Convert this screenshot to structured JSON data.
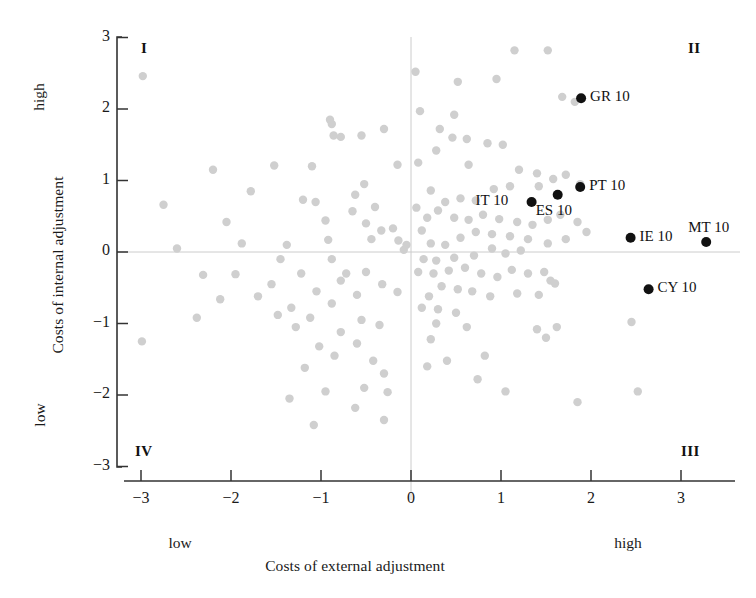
{
  "figure": {
    "background_color": "#ffffff",
    "point_color_normal": "#cfcfcf",
    "point_color_highlight": "#111111",
    "axis_color": "#222222",
    "zero_line_color": "#cccccc"
  },
  "axes": {
    "x_title": "Costs of external adjustment",
    "y_title": "Costs of internal adjustment",
    "x_low_label": "low",
    "x_high_label": "high",
    "y_low_label": "low",
    "y_high_label": "high",
    "x_ticks": [
      "−3",
      "−2",
      "−1",
      "0",
      "1",
      "2",
      "3"
    ],
    "y_ticks": [
      "3",
      "2",
      "1",
      "0",
      "−1",
      "−2",
      "−3"
    ]
  },
  "quadrants": [
    {
      "name": "quadrant-I",
      "label": "I",
      "x": 141,
      "y": 40
    },
    {
      "name": "quadrant-II",
      "label": "II",
      "x": 688,
      "y": 40
    },
    {
      "name": "quadrant-III",
      "label": "III",
      "x": 681,
      "y": 443
    },
    {
      "name": "quadrant-IV",
      "label": "IV",
      "x": 135,
      "y": 443
    }
  ],
  "chart_data": {
    "type": "scatter",
    "title": "",
    "xlabel": "Costs of external adjustment",
    "ylabel": "Costs of internal adjustment",
    "xlim": [
      -3.4,
      3.6
    ],
    "ylim": [
      -3.0,
      3.0
    ],
    "grid": false,
    "legend": null,
    "zero_reference_lines": {
      "x": 0,
      "y": 0
    },
    "annotations": [
      "I",
      "II",
      "III",
      "IV"
    ],
    "series": [
      {
        "name": "highlighted-countries",
        "color": "#111111",
        "marker": "filled-circle",
        "points": [
          {
            "label": "GR 10",
            "x": 1.89,
            "y": 2.15,
            "label_side": "right"
          },
          {
            "label": "PT 10",
            "x": 1.88,
            "y": 0.91,
            "label_side": "right"
          },
          {
            "label": "ES 10",
            "x": 1.63,
            "y": 0.8,
            "label_side": "below"
          },
          {
            "label": "IT 10",
            "x": 1.34,
            "y": 0.7,
            "label_side": "left"
          },
          {
            "label": "IE 10",
            "x": 2.44,
            "y": 0.2,
            "label_side": "right"
          },
          {
            "label": "MT 10",
            "x": 3.28,
            "y": 0.14,
            "label_side": "above-right"
          },
          {
            "label": "CY 10",
            "x": 2.64,
            "y": -0.52,
            "label_side": "right"
          }
        ]
      },
      {
        "name": "background-observations",
        "color": "#cfcfcf",
        "marker": "filled-circle",
        "points": [
          {
            "x": -2.98,
            "y": 2.46
          },
          {
            "x": -2.75,
            "y": 0.66
          },
          {
            "x": -2.99,
            "y": -1.25
          },
          {
            "x": -2.31,
            "y": -0.32
          },
          {
            "x": -1.78,
            "y": 0.85
          },
          {
            "x": -1.95,
            "y": -0.31
          },
          {
            "x": -1.52,
            "y": 1.21
          },
          {
            "x": -1.1,
            "y": 1.2
          },
          {
            "x": -1.38,
            "y": 0.1
          },
          {
            "x": -1.2,
            "y": 0.73
          },
          {
            "x": -1.06,
            "y": 0.7
          },
          {
            "x": -0.95,
            "y": 0.44
          },
          {
            "x": -0.92,
            "y": 0.17
          },
          {
            "x": -0.88,
            "y": 1.79
          },
          {
            "x": -0.9,
            "y": 1.85
          },
          {
            "x": -0.86,
            "y": 1.63
          },
          {
            "x": -0.78,
            "y": 1.61
          },
          {
            "x": -0.55,
            "y": 1.63
          },
          {
            "x": -0.3,
            "y": 1.72
          },
          {
            "x": -0.15,
            "y": 1.22
          },
          {
            "x": -0.52,
            "y": 0.95
          },
          {
            "x": -0.62,
            "y": 0.8
          },
          {
            "x": -0.65,
            "y": 0.57
          },
          {
            "x": -0.4,
            "y": 0.63
          },
          {
            "x": -0.5,
            "y": 0.4
          },
          {
            "x": -0.33,
            "y": 0.3
          },
          {
            "x": -0.44,
            "y": 0.18
          },
          {
            "x": -0.2,
            "y": 0.33
          },
          {
            "x": -0.14,
            "y": 0.16
          },
          {
            "x": -0.08,
            "y": 0.03
          },
          {
            "x": -0.05,
            "y": 0.1
          },
          {
            "x": -0.88,
            "y": -0.1
          },
          {
            "x": -0.72,
            "y": -0.3
          },
          {
            "x": -0.78,
            "y": -0.4
          },
          {
            "x": -0.5,
            "y": -0.28
          },
          {
            "x": -0.32,
            "y": -0.45
          },
          {
            "x": -0.15,
            "y": -0.56
          },
          {
            "x": -0.6,
            "y": -0.6
          },
          {
            "x": -0.88,
            "y": -0.72
          },
          {
            "x": -1.05,
            "y": -0.55
          },
          {
            "x": -1.22,
            "y": -0.3
          },
          {
            "x": -1.45,
            "y": -0.1
          },
          {
            "x": -1.55,
            "y": -0.45
          },
          {
            "x": -1.7,
            "y": -0.62
          },
          {
            "x": -1.33,
            "y": -0.78
          },
          {
            "x": -1.12,
            "y": -0.92
          },
          {
            "x": -1.28,
            "y": -1.05
          },
          {
            "x": -1.48,
            "y": -0.88
          },
          {
            "x": -1.02,
            "y": -1.32
          },
          {
            "x": -0.78,
            "y": -1.12
          },
          {
            "x": -0.55,
            "y": -0.95
          },
          {
            "x": -0.35,
            "y": -1.02
          },
          {
            "x": -0.6,
            "y": -1.28
          },
          {
            "x": -0.85,
            "y": -1.45
          },
          {
            "x": -0.42,
            "y": -1.52
          },
          {
            "x": -0.3,
            "y": -1.7
          },
          {
            "x": -0.52,
            "y": -1.9
          },
          {
            "x": -0.26,
            "y": -1.96
          },
          {
            "x": -0.62,
            "y": -2.18
          },
          {
            "x": -0.3,
            "y": -2.35
          },
          {
            "x": -0.95,
            "y": -1.95
          },
          {
            "x": -1.18,
            "y": -1.62
          },
          {
            "x": -1.35,
            "y": -2.05
          },
          {
            "x": -1.08,
            "y": -2.42
          },
          {
            "x": -2.12,
            "y": -0.66
          },
          {
            "x": -2.38,
            "y": -0.92
          },
          {
            "x": -2.6,
            "y": 0.05
          },
          {
            "x": -2.2,
            "y": 1.15
          },
          {
            "x": -1.88,
            "y": 0.12
          },
          {
            "x": -2.05,
            "y": 0.42
          },
          {
            "x": 0.05,
            "y": 2.52
          },
          {
            "x": 0.52,
            "y": 2.38
          },
          {
            "x": 1.15,
            "y": 2.82
          },
          {
            "x": 0.95,
            "y": 2.42
          },
          {
            "x": 1.68,
            "y": 2.17
          },
          {
            "x": 1.82,
            "y": 2.1
          },
          {
            "x": 1.52,
            "y": 2.82
          },
          {
            "x": 0.1,
            "y": 1.97
          },
          {
            "x": 0.32,
            "y": 1.72
          },
          {
            "x": 0.48,
            "y": 1.92
          },
          {
            "x": 0.46,
            "y": 1.6
          },
          {
            "x": 0.62,
            "y": 1.58
          },
          {
            "x": 0.28,
            "y": 1.42
          },
          {
            "x": 0.64,
            "y": 1.22
          },
          {
            "x": 0.08,
            "y": 1.25
          },
          {
            "x": 0.85,
            "y": 1.52
          },
          {
            "x": 1.02,
            "y": 1.5
          },
          {
            "x": 1.2,
            "y": 1.15
          },
          {
            "x": 1.4,
            "y": 1.1
          },
          {
            "x": 1.58,
            "y": 1.02
          },
          {
            "x": 1.72,
            "y": 1.08
          },
          {
            "x": 1.88,
            "y": 0.95
          },
          {
            "x": 1.42,
            "y": 0.92
          },
          {
            "x": 1.1,
            "y": 0.92
          },
          {
            "x": 0.92,
            "y": 0.88
          },
          {
            "x": 0.72,
            "y": 0.72
          },
          {
            "x": 0.55,
            "y": 0.75
          },
          {
            "x": 0.38,
            "y": 0.7
          },
          {
            "x": 0.22,
            "y": 0.86
          },
          {
            "x": 0.3,
            "y": 0.58
          },
          {
            "x": 0.48,
            "y": 0.48
          },
          {
            "x": 0.64,
            "y": 0.45
          },
          {
            "x": 0.8,
            "y": 0.52
          },
          {
            "x": 0.98,
            "y": 0.46
          },
          {
            "x": 1.18,
            "y": 0.42
          },
          {
            "x": 1.35,
            "y": 0.38
          },
          {
            "x": 1.52,
            "y": 0.45
          },
          {
            "x": 1.66,
            "y": 0.52
          },
          {
            "x": 1.85,
            "y": 0.42
          },
          {
            "x": 1.95,
            "y": 0.28
          },
          {
            "x": 1.72,
            "y": 0.18
          },
          {
            "x": 1.52,
            "y": 0.12
          },
          {
            "x": 1.3,
            "y": 0.18
          },
          {
            "x": 1.1,
            "y": 0.22
          },
          {
            "x": 0.9,
            "y": 0.25
          },
          {
            "x": 0.72,
            "y": 0.28
          },
          {
            "x": 0.55,
            "y": 0.2
          },
          {
            "x": 0.38,
            "y": 0.1
          },
          {
            "x": 0.22,
            "y": 0.12
          },
          {
            "x": 0.12,
            "y": 0.3
          },
          {
            "x": 0.18,
            "y": 0.48
          },
          {
            "x": 0.06,
            "y": 0.62
          },
          {
            "x": 0.9,
            "y": 0.05
          },
          {
            "x": 1.05,
            "y": -0.02
          },
          {
            "x": 1.22,
            "y": 0.02
          },
          {
            "x": 0.7,
            "y": -0.05
          },
          {
            "x": 0.48,
            "y": -0.08
          },
          {
            "x": 0.28,
            "y": -0.12
          },
          {
            "x": 0.14,
            "y": -0.1
          },
          {
            "x": 0.08,
            "y": -0.28
          },
          {
            "x": 0.25,
            "y": -0.3
          },
          {
            "x": 0.42,
            "y": -0.26
          },
          {
            "x": 0.6,
            "y": -0.22
          },
          {
            "x": 0.78,
            "y": -0.3
          },
          {
            "x": 0.96,
            "y": -0.35
          },
          {
            "x": 1.12,
            "y": -0.25
          },
          {
            "x": 1.3,
            "y": -0.3
          },
          {
            "x": 1.48,
            "y": -0.28
          },
          {
            "x": 1.55,
            "y": -0.4
          },
          {
            "x": 1.6,
            "y": -0.44
          },
          {
            "x": 0.34,
            "y": -0.48
          },
          {
            "x": 0.52,
            "y": -0.52
          },
          {
            "x": 0.68,
            "y": -0.55
          },
          {
            "x": 0.88,
            "y": -0.62
          },
          {
            "x": 1.18,
            "y": -0.58
          },
          {
            "x": 1.42,
            "y": -0.6
          },
          {
            "x": 0.2,
            "y": -0.62
          },
          {
            "x": 0.12,
            "y": -0.78
          },
          {
            "x": 0.3,
            "y": -0.8
          },
          {
            "x": 0.5,
            "y": -0.85
          },
          {
            "x": 0.28,
            "y": -1.0
          },
          {
            "x": 0.62,
            "y": -1.05
          },
          {
            "x": 1.4,
            "y": -1.08
          },
          {
            "x": 2.45,
            "y": -0.98
          },
          {
            "x": 2.52,
            "y": -1.95
          },
          {
            "x": 1.62,
            "y": -1.05
          },
          {
            "x": 1.85,
            "y": -2.1
          },
          {
            "x": 1.5,
            "y": -1.2
          },
          {
            "x": 0.82,
            "y": -1.45
          },
          {
            "x": 0.4,
            "y": -1.52
          },
          {
            "x": 0.18,
            "y": -1.6
          },
          {
            "x": 0.74,
            "y": -1.78
          },
          {
            "x": 1.05,
            "y": -1.95
          },
          {
            "x": 0.22,
            "y": -1.22
          }
        ]
      }
    ]
  }
}
